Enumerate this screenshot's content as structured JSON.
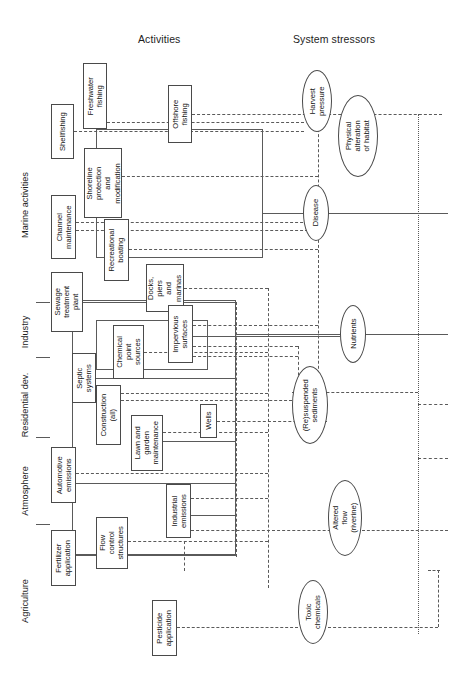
{
  "figure": {
    "kind": "conceptual-linkage-diagram",
    "orientation": "rotated-90-ccw",
    "headers": {
      "activities": "Activities",
      "stressors": "System stressors"
    }
  },
  "categories": [
    {
      "id": "marine-activities",
      "label": "Marine activities"
    },
    {
      "id": "industry",
      "label": "Industry"
    },
    {
      "id": "residential-dev",
      "label": "Residential dev."
    },
    {
      "id": "atmosphere",
      "label": "Atmosphere"
    },
    {
      "id": "agriculture",
      "label": "Agriculture"
    }
  ],
  "activities": [
    {
      "id": "freshwater-fishing",
      "label": "Freshwater\nfishing"
    },
    {
      "id": "shellfishing",
      "label": "Shellfishing"
    },
    {
      "id": "offshore-fishing",
      "label": "Offshore\nfishing"
    },
    {
      "id": "shoreline-protection",
      "label": "Shoreline\nprotection\nand\nmodification"
    },
    {
      "id": "channel-maintenance",
      "label": "Channel\nmaintenance"
    },
    {
      "id": "recreational-boating",
      "label": "Recreational\nboating"
    },
    {
      "id": "docks-piers-marinas",
      "label": "Docks,\npiers\nand\nmarinas"
    },
    {
      "id": "sewage-treatment-plant",
      "label": "Sewage\ntreatment\nplant"
    },
    {
      "id": "impervious-surfaces",
      "label": "Impervious\nsurfaces"
    },
    {
      "id": "chemical-point-sources",
      "label": "Chemical\npoint\nsources"
    },
    {
      "id": "septic-systems",
      "label": "Septic\nsystems"
    },
    {
      "id": "construction-all",
      "label": "Construction\n(all)"
    },
    {
      "id": "wells",
      "label": "Wells"
    },
    {
      "id": "lawn-and-garden-maintenance",
      "label": "Lawn and\ngarden\nmaintenance"
    },
    {
      "id": "automotive-emissions",
      "label": "Automotive\nemissions"
    },
    {
      "id": "industrial-emissions",
      "label": "Industrial\nemissions"
    },
    {
      "id": "flow-control-structures",
      "label": "Flow\ncontrol\nstructures"
    },
    {
      "id": "fertilizer-application",
      "label": "Fertilizer\napplication"
    },
    {
      "id": "pesticide-application",
      "label": "Pesticide\napplication"
    }
  ],
  "stressors": [
    {
      "id": "harvest-pressure",
      "label": "Harvest\npressure"
    },
    {
      "id": "physical-alteration-of-habitat",
      "label": "Physical\nalteration\nof habitat"
    },
    {
      "id": "disease",
      "label": "Disease"
    },
    {
      "id": "nutrients",
      "label": "Nutrients"
    },
    {
      "id": "resuspended-sediments",
      "label": "(Re)suspended\nsediments"
    },
    {
      "id": "altered-flow-riverine",
      "label": "Altered\nflow\n(riverine)"
    },
    {
      "id": "toxic-chemicals",
      "label": "Toxic\nchemicals"
    }
  ],
  "colors": {
    "stroke": "#4a4a4a",
    "line": "#5a5a5a",
    "text": "#1a1a1a",
    "background": "#ffffff"
  }
}
